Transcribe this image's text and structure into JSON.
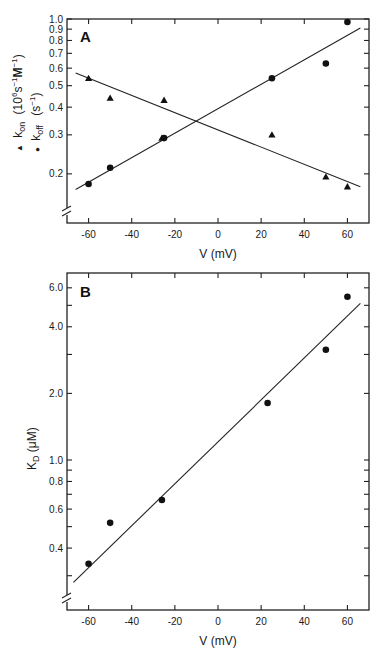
{
  "chart_data": [
    {
      "type": "scatter",
      "panel": "A",
      "title": "",
      "xlabel": "V (mV)",
      "ylabel_lines": [
        "▲ k_on (10^6 s^-1 M^-1)",
        "● k_off (s^-1)"
      ],
      "ylabel_parts": {
        "kon_marker": "▲",
        "kon_k": "k",
        "kon_sub": "on",
        "kon_unit": "(10",
        "kon_exp": "6",
        "kon_unit2": "s",
        "kon_exp2": "−1",
        "kon_unit3": "M",
        "kon_exp3": "−1",
        "kon_close": ")",
        "koff_marker": "●",
        "koff_k": "k",
        "koff_sub": "off",
        "koff_unit": "(s",
        "koff_exp": "−1",
        "koff_close": ")"
      },
      "xscale": "linear",
      "yscale": "log",
      "xlim": [
        -70,
        70
      ],
      "ylim": [
        0.12,
        1.0
      ],
      "xticks": [
        -60,
        -40,
        -20,
        0,
        20,
        40,
        60
      ],
      "xtick_labels": [
        "-60",
        "-40",
        "-20",
        "0",
        "20",
        "40",
        "60"
      ],
      "yticks": [
        0.2,
        0.3,
        0.4,
        0.5,
        0.6,
        0.7,
        0.8,
        0.9,
        1.0
      ],
      "ytick_labels": [
        "0.2",
        "0.3",
        "0.4",
        "0.5",
        "0.6",
        "0.7",
        "0.8",
        "0.9",
        "1.0"
      ],
      "axis_break": true,
      "grid": false,
      "legend": "in y-axis label (left)",
      "series": [
        {
          "name": "k_on",
          "marker": "triangle",
          "x": [
            -60,
            -50,
            -26,
            -25,
            25,
            50,
            60
          ],
          "y": [
            0.54,
            0.44,
            0.29,
            0.43,
            0.3,
            0.194,
            0.175
          ],
          "fit": {
            "x": [
              -66,
              66
            ],
            "y": [
              0.57,
              0.175
            ]
          }
        },
        {
          "name": "k_off",
          "marker": "circle",
          "x": [
            -60,
            -50,
            -25,
            25,
            50,
            60
          ],
          "y": [
            0.18,
            0.213,
            0.29,
            0.54,
            0.63,
            0.97
          ],
          "fit": {
            "x": [
              -66,
              66
            ],
            "y": [
              0.17,
              0.91
            ]
          }
        }
      ]
    },
    {
      "type": "scatter",
      "panel": "B",
      "title": "",
      "xlabel": "V (mV)",
      "ylabel": "K_D (μM)",
      "ylabel_parts": {
        "k": "K",
        "sub": "D",
        "unit": " (μM)"
      },
      "xscale": "linear",
      "yscale": "log",
      "xlim": [
        -70,
        70
      ],
      "ylim": [
        0.21,
        7.0
      ],
      "xticks": [
        -60,
        -40,
        -20,
        0,
        20,
        40,
        60
      ],
      "xtick_labels": [
        "-60",
        "-40",
        "-20",
        "0",
        "20",
        "40",
        "60"
      ],
      "yticks": [
        0.3,
        0.4,
        0.5,
        0.6,
        0.7,
        0.8,
        0.9,
        1.0,
        2.0,
        3.0,
        4.0,
        5.0,
        6.0
      ],
      "ytick_labels": [
        "",
        "0.4",
        "",
        "0.6",
        "",
        "0.8",
        "",
        "1.0",
        "2.0",
        "",
        "4.0",
        "",
        "6.0"
      ],
      "axis_break": true,
      "grid": false,
      "series": [
        {
          "name": "K_D",
          "marker": "circle",
          "x": [
            -60,
            -50,
            -26,
            23,
            50,
            60
          ],
          "y": [
            0.34,
            0.52,
            0.66,
            1.81,
            3.15,
            5.47
          ],
          "fit": {
            "x": [
              -67,
              66
            ],
            "y": [
              0.28,
              5.1
            ]
          }
        }
      ]
    }
  ],
  "panels": {
    "a": {
      "letter": "A"
    },
    "b": {
      "letter": "B"
    }
  }
}
